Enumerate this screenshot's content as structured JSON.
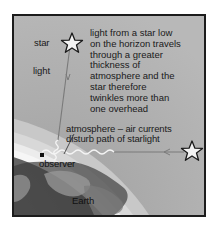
{
  "diagram": {
    "labels": {
      "star_top": "star",
      "light": "light",
      "explanation": [
        "light from a star low",
        "on the horizon travels",
        "through a greater",
        "thickness of",
        "atmosphere and the",
        "star therefore",
        "twinkles more than",
        "one overhead"
      ],
      "atmosphere": [
        "atmosphere  –  air currents",
        "disturb path of starlight"
      ],
      "observer": "observer",
      "earth": "Earth"
    },
    "icons": {
      "overhead_star": "star-outline-icon",
      "horizon_star": "star-outline-icon",
      "observer_marker": "square-marker"
    },
    "colors": {
      "background": "#b4b4b4",
      "frame": "#1c1c1c",
      "earth_dark": "#4a4a4a",
      "earth_light": "#8c8c8c",
      "atmosphere_band": "#e6e6e6",
      "light_ray": "#7a7a7a",
      "text": "#1a1a1a"
    }
  }
}
